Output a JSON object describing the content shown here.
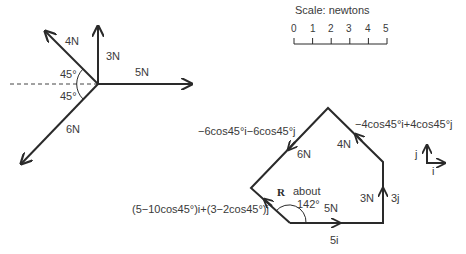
{
  "scale": {
    "title": "Scale: newtons",
    "ticks": [
      "0",
      "1",
      "2",
      "3",
      "4",
      "5"
    ]
  },
  "force_diagram": {
    "forces": [
      {
        "label": "4N",
        "magnitude": 4,
        "direction_deg": 135
      },
      {
        "label": "3N",
        "magnitude": 3,
        "direction_deg": 90
      },
      {
        "label": "5N",
        "magnitude": 5,
        "direction_deg": 0
      },
      {
        "label": "6N",
        "magnitude": 6,
        "direction_deg": 225
      }
    ],
    "angle_upper": "45°",
    "angle_lower": "45°"
  },
  "polygon": {
    "side_5": {
      "label": "5N",
      "vector": "5i"
    },
    "side_3": {
      "label": "3N",
      "vector": "3j"
    },
    "side_4": {
      "label": "4N",
      "vector": "−4cos45°i+4cos45°j"
    },
    "side_6": {
      "label": "6N",
      "vector": "−6cos45°i−6cos45°j"
    },
    "resultant": {
      "label": "R",
      "vector": "(5−10cos45°)i+(3−2cos45°)j"
    },
    "angle_note_1": "about",
    "angle_note_2": "142°"
  },
  "axes_key": {
    "i": "i",
    "j": "j"
  }
}
